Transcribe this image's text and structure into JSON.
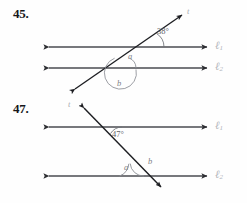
{
  "page": {
    "width": 247,
    "height": 203,
    "background": "#fefefe",
    "ink_color": "#2c2d31",
    "faint_color": "#b2b5bb"
  },
  "problems": [
    {
      "number": "45.",
      "figure": {
        "type": "two-parallel-lines-cut-by-transversal",
        "transversal_label": "t",
        "line_labels": [
          "ℓ",
          "ℓ"
        ],
        "line_label_subs": [
          "1",
          "2"
        ],
        "angles": [
          {
            "name": "38-degree-angle",
            "text": "38°",
            "x": 159,
            "y": 31
          },
          {
            "name": "angle-a",
            "text": "a",
            "x": 128,
            "y": 57
          },
          {
            "name": "angle-b",
            "text": "b",
            "x": 118,
            "y": 83
          }
        ],
        "geometry": {
          "line1": {
            "x1": 44,
            "y1": 47,
            "x2": 212,
            "y2": 47
          },
          "line2": {
            "x1": 44,
            "y1": 68,
            "x2": 212,
            "y2": 68
          },
          "transversal": {
            "x1": 71,
            "y1": 92,
            "x2": 186,
            "y2": 12
          }
        }
      }
    },
    {
      "number": "47.",
      "figure": {
        "type": "two-parallel-lines-cut-by-transversal",
        "transversal_label": "t",
        "line_labels": [
          "ℓ",
          "ℓ"
        ],
        "line_label_subs": [
          "1",
          "2"
        ],
        "angles": [
          {
            "name": "47-degree-angle",
            "text": "47°",
            "x": 113,
            "y": 134
          },
          {
            "name": "angle-a",
            "text": "a",
            "x": 126,
            "y": 167
          },
          {
            "name": "angle-b",
            "text": "b",
            "x": 151,
            "y": 163
          }
        ],
        "geometry": {
          "line1": {
            "x1": 44,
            "y1": 127,
            "x2": 212,
            "y2": 127
          },
          "line2": {
            "x1": 44,
            "y1": 176,
            "x2": 212,
            "y2": 176
          },
          "transversal": {
            "x1": 80,
            "y1": 104,
            "x2": 164,
            "y2": 191
          }
        }
      }
    }
  ],
  "labels": {
    "t_label": "t",
    "ell": "ℓ",
    "sub_one": "1",
    "sub_two": "2",
    "angle_a": "a",
    "angle_b": "b",
    "deg_45": "38°",
    "deg_47": "47°"
  }
}
